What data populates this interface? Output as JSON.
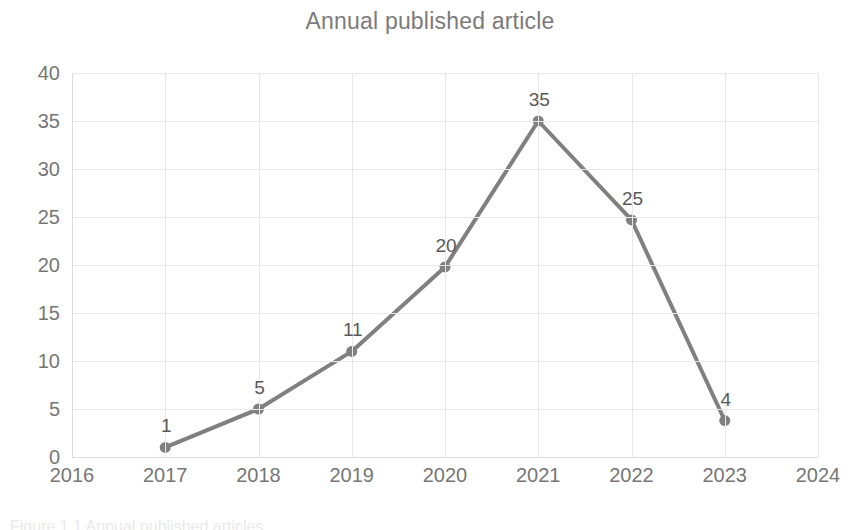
{
  "chart_data": {
    "type": "line",
    "title": "Annual published article",
    "xlabel": "",
    "ylabel": "",
    "categories": [
      "2016",
      "2017",
      "2018",
      "2019",
      "2020",
      "2021",
      "2022",
      "2023",
      "2024"
    ],
    "x": [
      2016,
      2017,
      2018,
      2019,
      2020,
      2021,
      2022,
      2023,
      2024
    ],
    "series": [
      {
        "name": "Annual published article",
        "x": [
          2017,
          2018,
          2019,
          2020,
          2021,
          2022,
          2023
        ],
        "values": [
          1,
          5,
          11,
          20,
          35,
          25,
          4
        ],
        "plotted_values": [
          1,
          5,
          11,
          19.8,
          35,
          24.7,
          3.8
        ],
        "data_labels": [
          "1",
          "5",
          "11",
          "20",
          "35",
          "25",
          "4"
        ],
        "color": "#808080",
        "line_width": 4,
        "marker": "circle",
        "marker_size": 11
      }
    ],
    "ylim": [
      0,
      40
    ],
    "yticks": [
      0,
      5,
      10,
      15,
      20,
      25,
      30,
      35,
      40
    ],
    "ytick_labels": [
      "0",
      "5",
      "10",
      "15",
      "20",
      "25",
      "30",
      "35",
      "40"
    ],
    "xlim": [
      2016,
      2024
    ],
    "xticks": [
      2016,
      2017,
      2018,
      2019,
      2020,
      2021,
      2022,
      2023,
      2024
    ],
    "xtick_labels": [
      "2016",
      "2017",
      "2018",
      "2019",
      "2020",
      "2021",
      "2022",
      "2023",
      "2024"
    ],
    "grid": true,
    "grid_color": "#e8e8e8",
    "legend": false,
    "legend_position": "none",
    "background_color": "#ffffff",
    "title_color": "#7b7b7b",
    "tick_label_color": "#767676",
    "data_label_color": "#595959"
  },
  "bottom_caption": {
    "text": "Figure 1.1 Annual published articles"
  }
}
